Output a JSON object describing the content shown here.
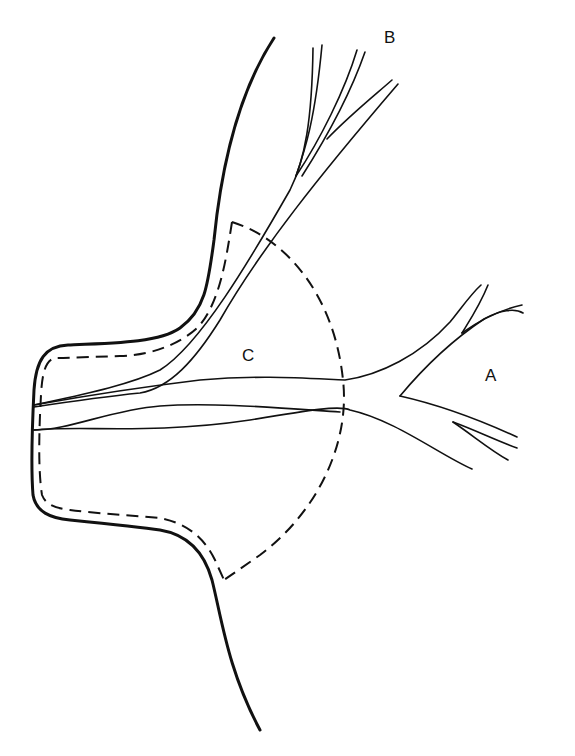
{
  "diagram": {
    "labels": {
      "a": "A",
      "b": "B",
      "c": "C"
    },
    "colors": {
      "background": "#ffffff",
      "stroke": "#111111"
    }
  }
}
